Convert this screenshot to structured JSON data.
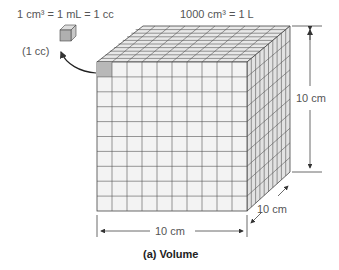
{
  "labels": {
    "unit_cube_equation": "1 cm³ = 1 mL = 1 cc",
    "unit_cube_note": "(1 cc)",
    "big_cube_equation": "1000 cm³ = 1 L",
    "height_dim": "10 cm",
    "width_dim": "10 cm",
    "depth_dim": "10 cm",
    "caption": "(a) Volume"
  },
  "colors": {
    "face": "#f2f2f2",
    "top": "#e6e6e6",
    "side": "#e0e0e0",
    "grid": "#555555",
    "highlight": "#b8b8b8"
  }
}
